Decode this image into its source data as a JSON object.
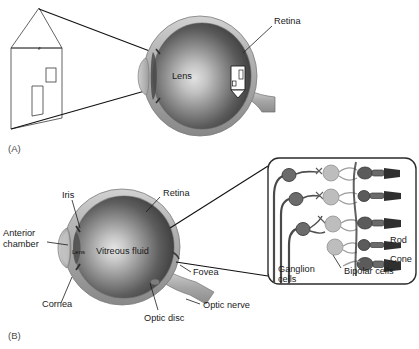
{
  "figure": {
    "panels": [
      {
        "tag": "(A)",
        "name": "optics-panel",
        "description": "Light rays from an external object (a house) pass through the lens and form an inverted image on the retina.",
        "labels": [
          {
            "id": "lens",
            "text": "Lens"
          },
          {
            "id": "retina",
            "text": "Retina"
          }
        ],
        "object": {
          "name": "house",
          "parts": [
            "roof",
            "wall",
            "door",
            "window"
          ]
        },
        "retinal_image": {
          "name": "inverted-house-image",
          "orientation": "inverted"
        },
        "rays": 2
      },
      {
        "tag": "(B)",
        "name": "anatomy-panel",
        "description": "Cross-section of the eye with principal anatomical structures labelled.",
        "labels": [
          {
            "id": "iris",
            "text": "Iris"
          },
          {
            "id": "retina",
            "text": "Retina"
          },
          {
            "id": "anterior-chamber",
            "text": "Anterior\nchamber",
            "line1": "Anterior",
            "line2": "chamber"
          },
          {
            "id": "lens",
            "text": "Lens"
          },
          {
            "id": "vitreous-fluid",
            "text": "Vitreous fluid"
          },
          {
            "id": "fovea",
            "text": "Fovea"
          },
          {
            "id": "cornea",
            "text": "Cornea"
          },
          {
            "id": "optic-disc",
            "text": "Optic disc"
          },
          {
            "id": "optic-nerve",
            "text": "Optic nerve"
          }
        ]
      }
    ],
    "inset": {
      "name": "retina-cell-inset",
      "description": "Magnified view of the retinal cell layers showing ganglion cells, bipolar cells and photoreceptors.",
      "labels": [
        {
          "id": "rod",
          "text": "Rod"
        },
        {
          "id": "cone",
          "text": "Cone"
        },
        {
          "id": "bipolar-cells",
          "text": "Bipolar cells"
        },
        {
          "id": "ganglion-cells",
          "line1": "Ganglion",
          "line2": "cells",
          "text": "Ganglion cells"
        }
      ],
      "rows": 5
    },
    "colors": {
      "background": "#ffffff",
      "text": "#1a1a1a",
      "panel_tag": "#4a4a4a",
      "sclera_light": "#c9c9c9",
      "sclera_mid": "#a8a8a8",
      "sclera_dark": "#8a8a8a",
      "vitreous_highlight": "#d8d8d8",
      "vitreous_mid": "#7d7d7d",
      "vitreous_dark": "#3c3c3c",
      "cell_body": "#6e6e6e",
      "cell_dark": "#404040",
      "cell_light": "#b4b4b4",
      "line": "#111111"
    }
  }
}
